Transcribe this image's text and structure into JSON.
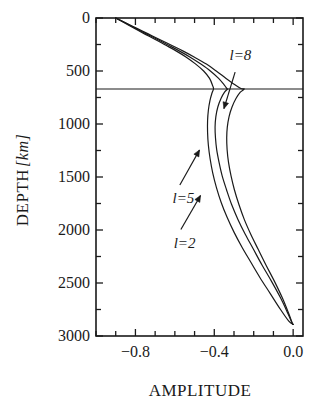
{
  "figure": {
    "axis_color": "#1a1a1a",
    "curve_color": "#1a1a1a",
    "background": "#ffffff"
  },
  "chart_data": {
    "type": "line",
    "title": "",
    "xlabel": "AMPLITUDE",
    "ylabel": "DEPTH",
    "ylabel_unit": "[km]",
    "ylabel_unit_open": "[",
    "ylabel_unit_text": "km",
    "ylabel_unit_close": "]",
    "xlim": [
      -1.0,
      0.05
    ],
    "ylim": [
      0,
      3000
    ],
    "y_inverted": true,
    "grid": false,
    "legend_position": "inline-annotations",
    "xticks": [
      -1.0,
      -0.9,
      -0.8,
      -0.7,
      -0.6,
      -0.5,
      -0.4,
      -0.3,
      -0.2,
      -0.1,
      0.0
    ],
    "xtick_labels": [
      {
        "value": -0.8,
        "text": "−0.8"
      },
      {
        "value": -0.4,
        "text": "−0.4"
      },
      {
        "value": 0.0,
        "text": "0.0"
      }
    ],
    "yticks": [
      0,
      250,
      500,
      750,
      1000,
      1250,
      1500,
      1750,
      2000,
      2250,
      2500,
      2750,
      3000
    ],
    "ytick_labels": [
      {
        "value": 0,
        "text": "0"
      },
      {
        "value": 500,
        "text": "500"
      },
      {
        "value": 1000,
        "text": "1000"
      },
      {
        "value": 1500,
        "text": "1500"
      },
      {
        "value": 2000,
        "text": "2000"
      },
      {
        "value": 2500,
        "text": "2500"
      },
      {
        "value": 3000,
        "text": "3000"
      }
    ],
    "reference_lines": [
      {
        "name": "670-km-discontinuity",
        "orientation": "horizontal",
        "y": 670
      }
    ],
    "series": [
      {
        "name": "l=8",
        "label_prefix": "l",
        "label_eq": "=",
        "label_value": "8",
        "points": [
          [
            -0.9,
            0
          ],
          [
            -0.845,
            50
          ],
          [
            -0.79,
            100
          ],
          [
            -0.735,
            150
          ],
          [
            -0.68,
            200
          ],
          [
            -0.62,
            255
          ],
          [
            -0.56,
            310
          ],
          [
            -0.5,
            370
          ],
          [
            -0.44,
            435
          ],
          [
            -0.39,
            500
          ],
          [
            -0.34,
            570
          ],
          [
            -0.295,
            630
          ],
          [
            -0.265,
            665
          ],
          [
            -0.248,
            670
          ],
          [
            -0.268,
            700
          ],
          [
            -0.29,
            760
          ],
          [
            -0.31,
            840
          ],
          [
            -0.325,
            930
          ],
          [
            -0.334,
            1030
          ],
          [
            -0.337,
            1130
          ],
          [
            -0.335,
            1240
          ],
          [
            -0.328,
            1360
          ],
          [
            -0.315,
            1490
          ],
          [
            -0.298,
            1620
          ],
          [
            -0.275,
            1760
          ],
          [
            -0.248,
            1900
          ],
          [
            -0.215,
            2040
          ],
          [
            -0.178,
            2180
          ],
          [
            -0.138,
            2330
          ],
          [
            -0.096,
            2480
          ],
          [
            -0.055,
            2640
          ],
          [
            -0.022,
            2790
          ],
          [
            -0.004,
            2880
          ],
          [
            0.0,
            2890
          ]
        ]
      },
      {
        "name": "l=5",
        "label_prefix": "l",
        "label_eq": "=",
        "label_value": "5",
        "points": [
          [
            -0.9,
            0
          ],
          [
            -0.848,
            50
          ],
          [
            -0.796,
            100
          ],
          [
            -0.744,
            150
          ],
          [
            -0.69,
            200
          ],
          [
            -0.634,
            255
          ],
          [
            -0.578,
            310
          ],
          [
            -0.522,
            370
          ],
          [
            -0.468,
            435
          ],
          [
            -0.42,
            500
          ],
          [
            -0.378,
            570
          ],
          [
            -0.348,
            635
          ],
          [
            -0.335,
            668
          ],
          [
            -0.332,
            670
          ],
          [
            -0.348,
            700
          ],
          [
            -0.366,
            760
          ],
          [
            -0.382,
            840
          ],
          [
            -0.392,
            930
          ],
          [
            -0.396,
            1030
          ],
          [
            -0.394,
            1130
          ],
          [
            -0.388,
            1240
          ],
          [
            -0.376,
            1360
          ],
          [
            -0.36,
            1490
          ],
          [
            -0.338,
            1620
          ],
          [
            -0.312,
            1760
          ],
          [
            -0.28,
            1900
          ],
          [
            -0.243,
            2040
          ],
          [
            -0.202,
            2180
          ],
          [
            -0.158,
            2330
          ],
          [
            -0.111,
            2480
          ],
          [
            -0.064,
            2640
          ],
          [
            -0.026,
            2790
          ],
          [
            -0.005,
            2880
          ],
          [
            0.0,
            2890
          ]
        ]
      },
      {
        "name": "l=2",
        "label_prefix": "l",
        "label_eq": "=",
        "label_value": "2",
        "points": [
          [
            -0.9,
            0
          ],
          [
            -0.852,
            50
          ],
          [
            -0.804,
            100
          ],
          [
            -0.754,
            150
          ],
          [
            -0.702,
            200
          ],
          [
            -0.648,
            255
          ],
          [
            -0.594,
            310
          ],
          [
            -0.542,
            370
          ],
          [
            -0.494,
            435
          ],
          [
            -0.454,
            500
          ],
          [
            -0.424,
            570
          ],
          [
            -0.408,
            640
          ],
          [
            -0.404,
            670
          ],
          [
            -0.412,
            710
          ],
          [
            -0.422,
            780
          ],
          [
            -0.43,
            870
          ],
          [
            -0.434,
            970
          ],
          [
            -0.434,
            1080
          ],
          [
            -0.43,
            1200
          ],
          [
            -0.421,
            1330
          ],
          [
            -0.408,
            1460
          ],
          [
            -0.389,
            1600
          ],
          [
            -0.365,
            1740
          ],
          [
            -0.335,
            1880
          ],
          [
            -0.3,
            2020
          ],
          [
            -0.26,
            2160
          ],
          [
            -0.216,
            2300
          ],
          [
            -0.168,
            2450
          ],
          [
            -0.116,
            2600
          ],
          [
            -0.064,
            2750
          ],
          [
            -0.022,
            2860
          ],
          [
            0.0,
            2890
          ]
        ]
      }
    ],
    "annotations": [
      {
        "name": "l8-annotation",
        "text": "l=8",
        "label_x": 0.645,
        "label_y": 0.095,
        "arrow_from": [
          0.672,
          0.17
        ],
        "arrow_to": [
          0.618,
          0.285
        ]
      },
      {
        "name": "l5-annotation",
        "text": "l=5",
        "label_x": 0.37,
        "label_y": 0.545,
        "arrow_from": [
          0.405,
          0.525
        ],
        "arrow_to": [
          0.5,
          0.415
        ]
      },
      {
        "name": "l2-annotation",
        "text": "l=2",
        "label_x": 0.375,
        "label_y": 0.685,
        "arrow_from": [
          0.41,
          0.665
        ],
        "arrow_to": [
          0.505,
          0.558
        ]
      }
    ]
  }
}
